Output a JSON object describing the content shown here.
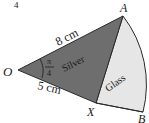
{
  "question_number": "4",
  "points": {
    "O": "O",
    "A": "A",
    "X": "X",
    "B": "B"
  },
  "labels": {
    "oa_length": "8 cm",
    "ox_length": "5 cm",
    "angle_num": "π",
    "angle_den": "4",
    "silver": "Silver",
    "glass": "Glass"
  },
  "colors": {
    "silver_fill": "#6e6e6e",
    "glass_fill": "#e6e6e6",
    "stroke": "#2a2a2a"
  }
}
